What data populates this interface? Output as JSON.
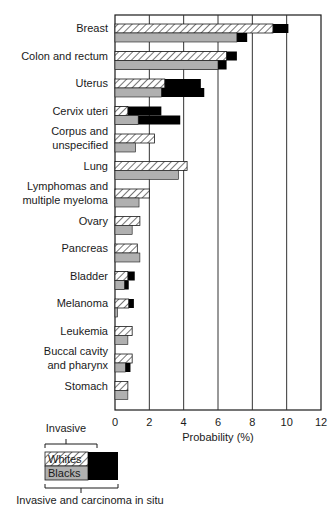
{
  "chart_data": {
    "type": "bar",
    "orientation": "horizontal",
    "title": "",
    "xlabel": "Probability (%)",
    "ylabel": "",
    "xlim": [
      0,
      12
    ],
    "xticks": [
      0,
      2,
      4,
      6,
      8,
      10,
      12
    ],
    "grid": "vertical",
    "categories": [
      [
        "Breast"
      ],
      [
        "Colon and rectum"
      ],
      [
        "Uterus"
      ],
      [
        "Cervix uteri"
      ],
      [
        "Corpus and",
        "unspecified"
      ],
      [
        "Lung"
      ],
      [
        "Lymphomas and",
        "multiple myeloma"
      ],
      [
        "Ovary"
      ],
      [
        "Pancreas"
      ],
      [
        "Bladder"
      ],
      [
        "Melanoma"
      ],
      [
        "Leukemia"
      ],
      [
        "Buccal cavity",
        "and pharynx"
      ],
      [
        "Stomach"
      ]
    ],
    "series": [
      {
        "name": "Whites - Invasive",
        "pattern": "hatched",
        "values": [
          9.2,
          6.5,
          2.9,
          0.75,
          2.3,
          4.2,
          2.0,
          1.45,
          1.3,
          0.75,
          0.8,
          1.0,
          1.0,
          0.75
        ]
      },
      {
        "name": "Whites - Invasive and carcinoma in situ",
        "color": "#000000",
        "values": [
          10.1,
          7.1,
          5.0,
          2.7,
          2.3,
          4.2,
          2.0,
          1.45,
          1.3,
          1.15,
          1.1,
          1.0,
          1.0,
          0.75
        ]
      },
      {
        "name": "Blacks - Invasive",
        "color": "#b0b0b0",
        "values": [
          7.1,
          6.0,
          2.7,
          1.35,
          1.2,
          3.7,
          1.4,
          1.0,
          1.45,
          0.55,
          0.15,
          0.75,
          0.6,
          0.75
        ]
      },
      {
        "name": "Blacks - Invasive and carcinoma in situ",
        "color": "#000000",
        "values": [
          7.7,
          6.5,
          5.2,
          3.8,
          1.2,
          3.7,
          1.4,
          1.0,
          1.45,
          0.8,
          0.15,
          0.75,
          0.9,
          0.75
        ]
      }
    ],
    "legend": {
      "position": "bottom-left",
      "top_label": "Invasive",
      "bottom_label": "Invasive and carcinoma in situ",
      "whites_label": "Whites",
      "blacks_label": "Blacks"
    }
  },
  "colors": {
    "gray": "#b0b0b0",
    "black": "#000000",
    "hatch": "#1a1a1a",
    "grid": "#333333"
  }
}
